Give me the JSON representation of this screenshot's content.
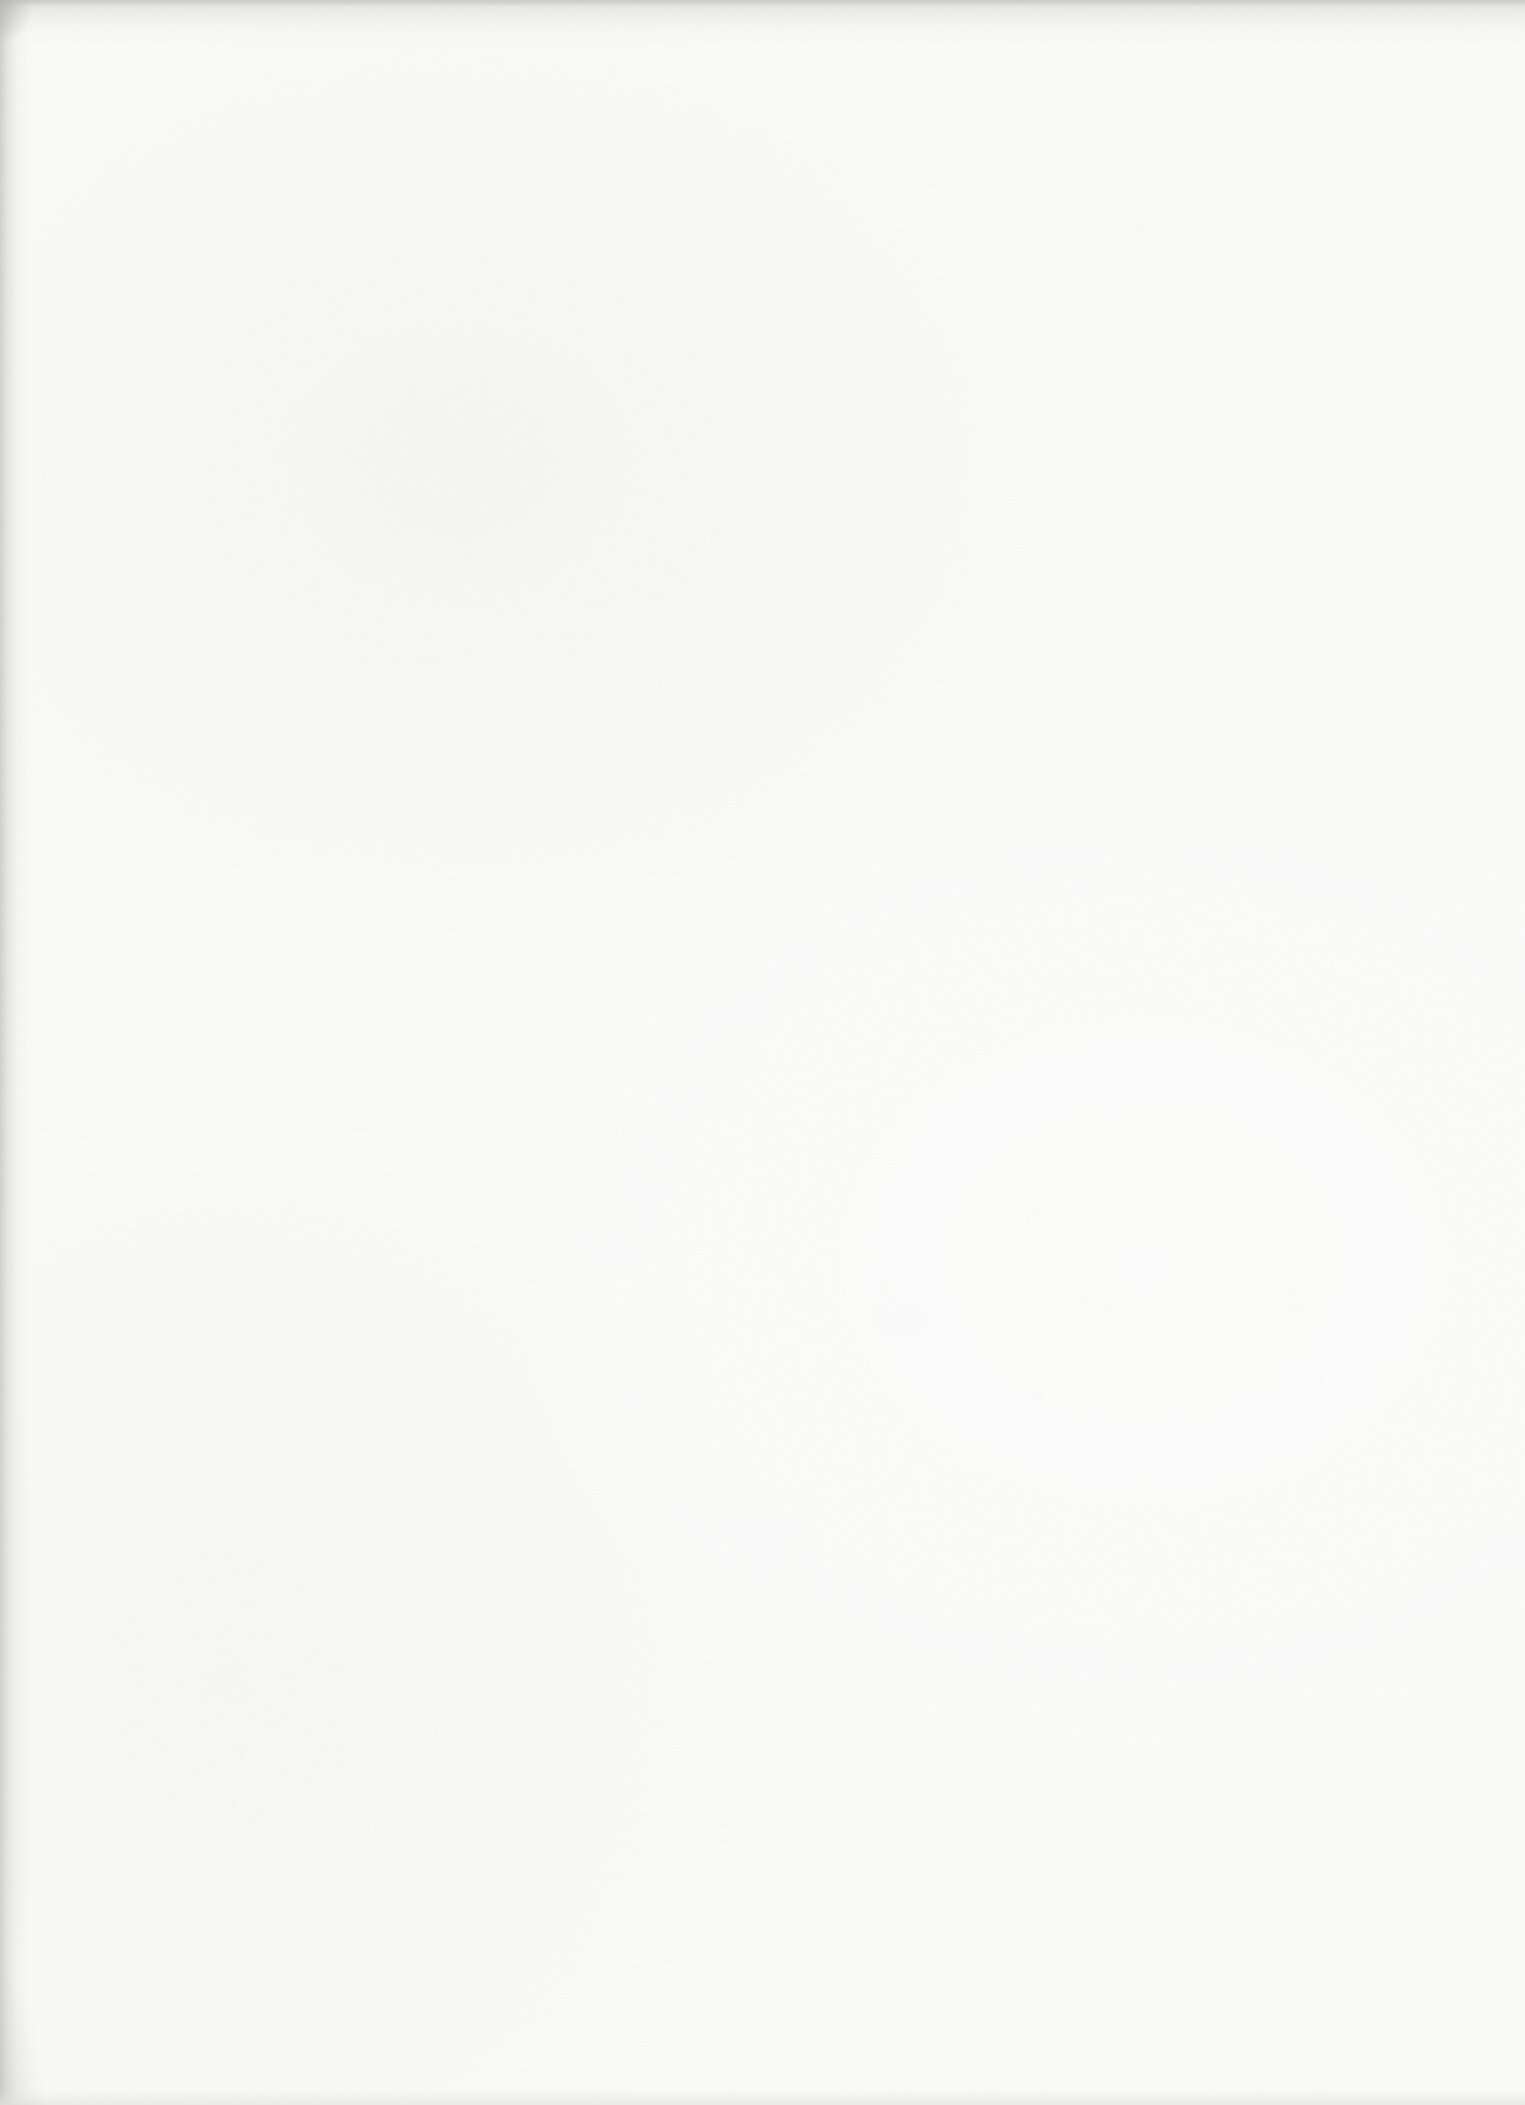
{
  "page": {
    "visible_text": "",
    "colors": {
      "paper": "#fafaf9",
      "scanner-bg": "#c9c9c7",
      "edge-top": "#d7d7d5",
      "edge-left": "#cfcfcd",
      "edge-bottom": "#e9e9e7"
    }
  }
}
